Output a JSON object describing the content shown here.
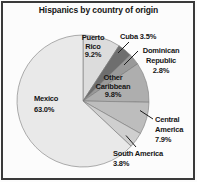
{
  "chart_data": {
    "type": "pie",
    "title": "Hispanics by country of origin",
    "start_angle_deg": 0,
    "direction": "clockwise",
    "total": 100.0,
    "categories": [
      "Puerto Rico",
      "Cuba",
      "Dominican Republic",
      "Other Caribbean",
      "Central America",
      "South America",
      "Mexico"
    ],
    "values": [
      9.2,
      3.5,
      2.8,
      9.8,
      7.9,
      3.8,
      63.0
    ],
    "legend": "none",
    "slices": [
      {
        "name": "Puerto Rico",
        "value": 9.2,
        "color": "#dcdcdc",
        "label_position": "inside",
        "label_lines": [
          "Puerto",
          "Rico",
          "9.2%"
        ]
      },
      {
        "name": "Cuba",
        "value": 3.5,
        "color": "#6e6e6e",
        "label_position": "outside",
        "label_lines": [
          "Cuba 3.5%"
        ]
      },
      {
        "name": "Dominican Republic",
        "value": 2.8,
        "color": "#999999",
        "label_position": "outside",
        "label_lines": [
          "Dominican",
          "Republic",
          "2.8%"
        ]
      },
      {
        "name": "Other Caribbean",
        "value": 9.8,
        "color": "#aeaeae",
        "label_position": "inside",
        "label_lines": [
          "Other",
          "Caribbean",
          "9.8%"
        ]
      },
      {
        "name": "Central America",
        "value": 7.9,
        "color": "#bdbdbd",
        "label_position": "outside",
        "label_lines": [
          "Central",
          "America",
          "7.9%"
        ]
      },
      {
        "name": "South America",
        "value": 3.8,
        "color": "#cfcfcf",
        "label_position": "outside",
        "label_lines": [
          "South America",
          "3.8%"
        ]
      },
      {
        "name": "Mexico",
        "value": 63.0,
        "color": "#e9e9e9",
        "label_position": "inside",
        "label_lines": [
          "Mexico",
          "63.0%"
        ]
      }
    ],
    "slice_border_color": "#787878",
    "frame_border_color": "#3a3a3a",
    "leader_line_color": "#1c1c1c"
  }
}
